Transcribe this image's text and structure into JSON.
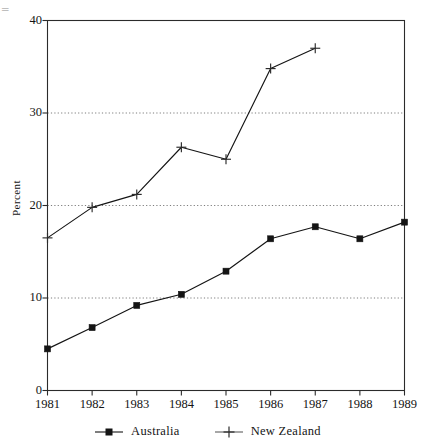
{
  "chart_data": {
    "type": "line",
    "title": "",
    "xlabel": "",
    "ylabel": "Percent",
    "categories": [
      "1981",
      "1982",
      "1983",
      "1984",
      "1985",
      "1986",
      "1987",
      "1988",
      "1989"
    ],
    "ylim": [
      0,
      40
    ],
    "yticks": [
      0,
      10,
      20,
      30,
      40
    ],
    "grid": "horizontal-dotted at 10, 20, 30",
    "legend_position": "bottom-center",
    "series": [
      {
        "name": "Australia",
        "marker": "filled-square",
        "values": [
          4.5,
          6.8,
          9.2,
          10.4,
          12.9,
          16.4,
          17.7,
          16.4,
          18.2
        ]
      },
      {
        "name": "New Zealand",
        "marker": "plus",
        "values": [
          16.5,
          19.8,
          21.2,
          26.3,
          25.0,
          34.8,
          37.0,
          null,
          null
        ]
      }
    ]
  },
  "axes": {
    "y_label": "Percent",
    "y_tick_labels": [
      "40",
      "30",
      "20",
      "10",
      "0"
    ],
    "x_tick_labels": [
      "1981",
      "1982",
      "1983",
      "1984",
      "1985",
      "1986",
      "1987",
      "1988",
      "1989"
    ]
  },
  "legend": {
    "entries": [
      {
        "label": "Australia",
        "marker": "filled-square"
      },
      {
        "label": "New Zealand",
        "marker": "plus"
      }
    ]
  },
  "artifact": {
    "top_left_mark": "̅̅"
  },
  "colors": {
    "ink": "#141414",
    "grid": "#6e6e6e",
    "axis": "#2b2b2b",
    "background": "#ffffff"
  }
}
